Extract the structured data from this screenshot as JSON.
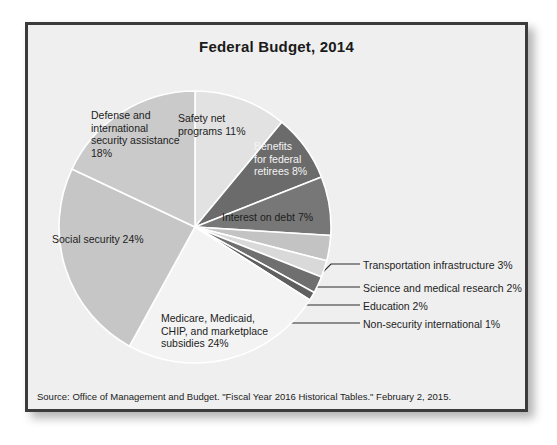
{
  "figure": {
    "title": "Federal Budget, 2014",
    "source": "Source: Office of Management and Budget. \"Fiscal Year 2016 Historical Tables.\" February 2, 2015.",
    "frame_border_color": "#3b3b3b",
    "background_color": "#efefef"
  },
  "chart_data": {
    "type": "pie",
    "title": "Federal Budget, 2014",
    "xlabel": "",
    "ylabel": "",
    "units": "percent of total federal budget",
    "start_angle_deg": 0,
    "direction": "clockwise",
    "legend": "none (direct labels and callouts)",
    "grid": false,
    "categories": [
      "Safety net programs",
      "Benefits for federal retirees",
      "Interest on debt",
      "Transportation infrastructure",
      "Science and medical research",
      "Education",
      "Non-security international",
      "Medicare, Medicaid, CHIP, and marketplace subsidies",
      "Social security",
      "Defense and international security assistance"
    ],
    "values": [
      11,
      8,
      7,
      3,
      2,
      2,
      1,
      24,
      24,
      18
    ],
    "slices": [
      {
        "name": "Safety net programs",
        "label": "Safety net\nprograms 11%",
        "value": 11,
        "color": "#e2e2e2",
        "label_mode": "inside",
        "label_color": "dark",
        "label_x": 150,
        "label_y": 87
      },
      {
        "name": "Benefits for federal retirees",
        "label": "Benefits\nfor federal\nretirees 8%",
        "value": 8,
        "color": "#6b6b6b",
        "label_mode": "inside",
        "label_color": "light",
        "label_x": 226,
        "label_y": 115
      },
      {
        "name": "Interest on debt",
        "label": "Interest on debt 7%",
        "value": 7,
        "color": "#777777",
        "label_mode": "inside",
        "label_color": "dark",
        "label_x": 194,
        "label_y": 186
      },
      {
        "name": "Transportation infrastructure",
        "label": "Transportation infrastructure 3%",
        "value": 3,
        "color": "#c3c3c3",
        "label_mode": "callout",
        "label_color": "dark",
        "label_x": 335,
        "label_y": 234,
        "leader": {
          "x1": 289,
          "y1": 253,
          "x2": 303,
          "y2": 239,
          "x3": 332,
          "y3": 239
        }
      },
      {
        "name": "Science and medical research",
        "label": "Science and medical research 2%",
        "value": 2,
        "color": "#d9d9d9",
        "label_mode": "callout",
        "label_color": "dark",
        "label_x": 335,
        "label_y": 257,
        "leader": {
          "x1": 272,
          "y1": 275,
          "x2": 288,
          "y2": 262,
          "x3": 332,
          "y3": 262
        }
      },
      {
        "name": "Education",
        "label": "Education 2%",
        "value": 2,
        "color": "#6f6f6f",
        "label_mode": "callout",
        "label_color": "dark",
        "label_x": 335,
        "label_y": 275,
        "leader": {
          "x1": 258,
          "y1": 288,
          "x2": 272,
          "y2": 280,
          "x3": 332,
          "y3": 280
        }
      },
      {
        "name": "Non-security international",
        "label": "Non-security international 1%",
        "value": 1,
        "color": "#5f5f5f",
        "label_mode": "callout",
        "label_color": "dark",
        "label_x": 335,
        "label_y": 293,
        "leader": {
          "x1": 246,
          "y1": 300,
          "x2": 262,
          "y2": 298,
          "x3": 332,
          "y3": 298
        }
      },
      {
        "name": "Medicare, Medicaid, CHIP, and marketplace subsidies",
        "label": "Medicare, Medicaid,\nCHIP, and marketplace\nsubsidies 24%",
        "value": 24,
        "color": "#f3f3f3",
        "label_mode": "inside",
        "label_color": "dark",
        "label_x": 133,
        "label_y": 287
      },
      {
        "name": "Social security",
        "label": "Social security 24%",
        "value": 24,
        "color": "#c6c6c6",
        "label_mode": "inside",
        "label_color": "dark",
        "label_x": 24,
        "label_y": 208
      },
      {
        "name": "Defense and international security assistance",
        "label": "Defense and\ninternational\nsecurity assistance\n18%",
        "value": 18,
        "color": "#cacaca",
        "label_mode": "inside",
        "label_color": "dark",
        "label_x": 63,
        "label_y": 84
      }
    ],
    "geometry": {
      "cx": 167,
      "cy": 202,
      "r": 136
    }
  }
}
